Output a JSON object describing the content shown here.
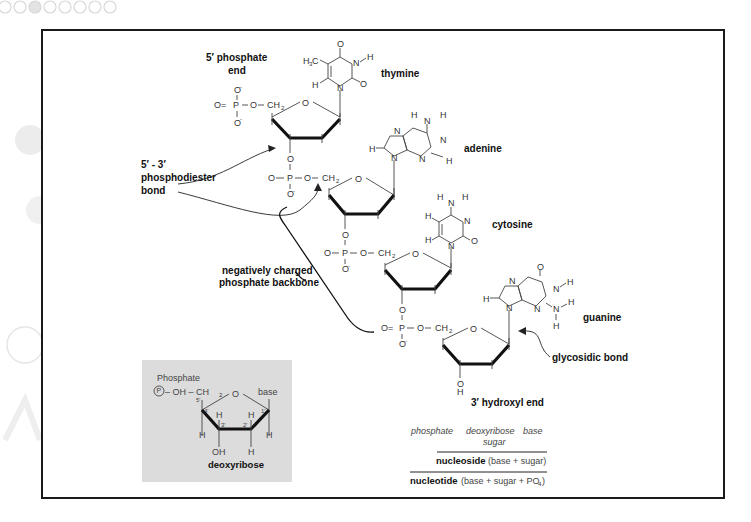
{
  "figure": {
    "labels": {
      "five_prime_end_line1": "5′ phosphate",
      "five_prime_end_line2": "end",
      "phosphodiester_line1": "5′ - 3′",
      "phosphodiester_line2": "phosphodiester",
      "phosphodiester_line3": "bond",
      "backbone_line1": "negatively charged",
      "backbone_line2": "phosphate backbone",
      "glycosidic": "glycosidic bond",
      "three_prime_end": "3′ hydroxyl end"
    },
    "bases": [
      {
        "name": "thymine"
      },
      {
        "name": "adenine"
      },
      {
        "name": "cytosine"
      },
      {
        "name": "guanine"
      }
    ],
    "atoms": {
      "O": "O",
      "O_minus": "O",
      "minus": "-",
      "P": "P",
      "N": "N",
      "H": "H",
      "CH2": "CH",
      "sub2": "2",
      "H3C": "H",
      "sub3": "3",
      "C": "C",
      "OH": "OH",
      "dash": "–",
      "eq": "=",
      "bar": "|"
    },
    "inset": {
      "phosphate_label": "Phosphate",
      "p_circle": "P",
      "oh_ch2": "– OH – CH",
      "sub2": "2",
      "ring_o": "O",
      "base": "base",
      "primes": [
        "5'",
        "4'",
        "3'",
        "2'",
        "1'"
      ],
      "h": "H",
      "oh": "OH",
      "title": "deoxyribose"
    },
    "legend": {
      "phosphate": "phosphate",
      "deoxyribose": "deoxyribose",
      "sugar": "sugar",
      "base": "base",
      "nucleoside": "nucleoside",
      "nucleoside_desc": "(base + sugar)",
      "nucleotide": "nucleotide",
      "nucleotide_desc": "(base + sugar + PO",
      "nucleotide_sub": "4",
      "nucleotide_close": ")"
    }
  },
  "colors": {
    "frame": "#1a1a1a",
    "inset_bg": "#dcdcdc",
    "text": "#111111"
  }
}
